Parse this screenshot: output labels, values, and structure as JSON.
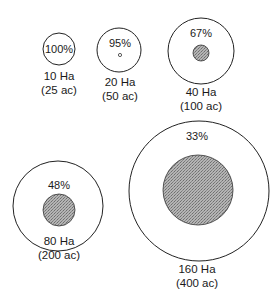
{
  "diagram": {
    "type": "nested-circle-area-comparison",
    "items": [
      {
        "id": "c10",
        "percent": "100%",
        "hectares": "10 Ha",
        "acres": "(25 ac)",
        "outer_r": 16,
        "inner_r": 0,
        "cx": 59,
        "cy": 49
      },
      {
        "id": "c20",
        "percent": "95%",
        "hectares": "20 Ha",
        "acres": "(50 ac)",
        "outer_r": 22,
        "inner_r": 1.5,
        "cx": 119,
        "cy": 50
      },
      {
        "id": "c40",
        "percent": "67%",
        "hectares": "40 Ha",
        "acres": "(100 ac)",
        "outer_r": 33,
        "inner_r": 8,
        "cx": 201,
        "cy": 51
      },
      {
        "id": "c80",
        "percent": "48%",
        "hectares": "80 Ha",
        "acres": "(200 ac)",
        "outer_r": 45,
        "inner_r": 16,
        "cx": 58,
        "cy": 205
      },
      {
        "id": "c160",
        "percent": "33%",
        "hectares": "160 Ha",
        "acres": "(400 ac)",
        "outer_r": 70,
        "inner_r": 35,
        "cx": 207,
        "cy": 186
      }
    ],
    "colors": {
      "outline": "#222222",
      "shade": "#a8a8a8",
      "background": "#ffffff"
    }
  }
}
